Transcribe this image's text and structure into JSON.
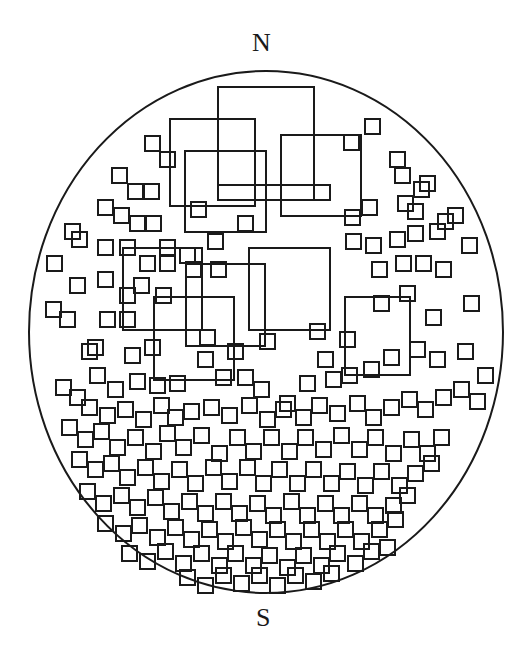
{
  "labels": {
    "north": "N",
    "south": "S"
  },
  "style": {
    "stroke": "#1a1a1a",
    "background": "#ffffff"
  },
  "boundary": {
    "cx": 266,
    "cy": 332,
    "rx": 237,
    "ry": 261
  },
  "large_squares": [
    [
      218,
      87,
      96,
      113
    ],
    [
      170,
      119,
      85,
      87
    ],
    [
      185,
      151,
      81,
      81
    ],
    [
      281,
      135,
      80,
      81
    ],
    [
      314,
      185,
      16,
      15
    ],
    [
      218,
      185,
      96,
      15
    ],
    [
      123,
      248,
      79,
      82
    ],
    [
      186,
      264,
      79,
      82
    ],
    [
      154,
      297,
      80,
      83
    ],
    [
      249,
      248,
      81,
      82
    ],
    [
      345,
      297,
      65,
      78
    ]
  ],
  "small_squares": [
    [
      365,
      119
    ],
    [
      344,
      135
    ],
    [
      145,
      136
    ],
    [
      160,
      152
    ],
    [
      112,
      168
    ],
    [
      128,
      184
    ],
    [
      144,
      184
    ],
    [
      395,
      168
    ],
    [
      390,
      152
    ],
    [
      98,
      200
    ],
    [
      114,
      208
    ],
    [
      130,
      216
    ],
    [
      146,
      216
    ],
    [
      191,
      202
    ],
    [
      208,
      234
    ],
    [
      238,
      216
    ],
    [
      345,
      210
    ],
    [
      362,
      200
    ],
    [
      414,
      182
    ],
    [
      420,
      176
    ],
    [
      398,
      196
    ],
    [
      408,
      204
    ],
    [
      65,
      224
    ],
    [
      72,
      232
    ],
    [
      98,
      240
    ],
    [
      120,
      240
    ],
    [
      140,
      256
    ],
    [
      160,
      256
    ],
    [
      180,
      248
    ],
    [
      186,
      262
    ],
    [
      211,
      262
    ],
    [
      346,
      234
    ],
    [
      366,
      238
    ],
    [
      390,
      232
    ],
    [
      408,
      226
    ],
    [
      430,
      224
    ],
    [
      438,
      214
    ],
    [
      448,
      208
    ],
    [
      462,
      238
    ],
    [
      47,
      256
    ],
    [
      70,
      278
    ],
    [
      98,
      272
    ],
    [
      120,
      288
    ],
    [
      134,
      278
    ],
    [
      156,
      288
    ],
    [
      160,
      240
    ],
    [
      372,
      262
    ],
    [
      396,
      256
    ],
    [
      416,
      256
    ],
    [
      436,
      262
    ],
    [
      46,
      302
    ],
    [
      60,
      312
    ],
    [
      82,
      344
    ],
    [
      100,
      312
    ],
    [
      120,
      312
    ],
    [
      125,
      348
    ],
    [
      145,
      340
    ],
    [
      200,
      330
    ],
    [
      228,
      344
    ],
    [
      260,
      334
    ],
    [
      310,
      324
    ],
    [
      318,
      352
    ],
    [
      340,
      332
    ],
    [
      374,
      296
    ],
    [
      400,
      286
    ],
    [
      426,
      310
    ],
    [
      464,
      296
    ],
    [
      88,
      340
    ],
    [
      90,
      368
    ],
    [
      108,
      382
    ],
    [
      130,
      374
    ],
    [
      150,
      378
    ],
    [
      170,
      376
    ],
    [
      198,
      352
    ],
    [
      216,
      370
    ],
    [
      238,
      370
    ],
    [
      254,
      382
    ],
    [
      280,
      396
    ],
    [
      300,
      376
    ],
    [
      326,
      372
    ],
    [
      342,
      368
    ],
    [
      364,
      362
    ],
    [
      384,
      350
    ],
    [
      410,
      342
    ],
    [
      430,
      352
    ],
    [
      458,
      344
    ],
    [
      478,
      368
    ],
    [
      56,
      380
    ],
    [
      70,
      390
    ],
    [
      82,
      400
    ],
    [
      100,
      408
    ],
    [
      118,
      402
    ],
    [
      136,
      412
    ],
    [
      154,
      398
    ],
    [
      168,
      410
    ],
    [
      184,
      404
    ],
    [
      204,
      400
    ],
    [
      222,
      408
    ],
    [
      242,
      398
    ],
    [
      260,
      412
    ],
    [
      276,
      402
    ],
    [
      296,
      410
    ],
    [
      312,
      398
    ],
    [
      330,
      406
    ],
    [
      350,
      396
    ],
    [
      366,
      410
    ],
    [
      384,
      400
    ],
    [
      402,
      392
    ],
    [
      418,
      402
    ],
    [
      436,
      390
    ],
    [
      454,
      382
    ],
    [
      470,
      394
    ],
    [
      62,
      420
    ],
    [
      78,
      432
    ],
    [
      94,
      424
    ],
    [
      110,
      440
    ],
    [
      128,
      430
    ],
    [
      146,
      444
    ],
    [
      160,
      426
    ],
    [
      176,
      440
    ],
    [
      194,
      428
    ],
    [
      212,
      446
    ],
    [
      230,
      430
    ],
    [
      246,
      444
    ],
    [
      264,
      430
    ],
    [
      282,
      444
    ],
    [
      298,
      430
    ],
    [
      316,
      442
    ],
    [
      334,
      428
    ],
    [
      352,
      442
    ],
    [
      368,
      430
    ],
    [
      386,
      446
    ],
    [
      404,
      432
    ],
    [
      420,
      446
    ],
    [
      434,
      430
    ],
    [
      72,
      452
    ],
    [
      88,
      462
    ],
    [
      104,
      456
    ],
    [
      120,
      470
    ],
    [
      138,
      460
    ],
    [
      154,
      474
    ],
    [
      172,
      462
    ],
    [
      188,
      476
    ],
    [
      206,
      460
    ],
    [
      222,
      474
    ],
    [
      240,
      460
    ],
    [
      256,
      476
    ],
    [
      272,
      462
    ],
    [
      290,
      476
    ],
    [
      306,
      462
    ],
    [
      324,
      476
    ],
    [
      340,
      464
    ],
    [
      358,
      478
    ],
    [
      374,
      464
    ],
    [
      392,
      478
    ],
    [
      408,
      466
    ],
    [
      424,
      456
    ],
    [
      80,
      484
    ],
    [
      96,
      496
    ],
    [
      114,
      488
    ],
    [
      130,
      500
    ],
    [
      148,
      490
    ],
    [
      164,
      504
    ],
    [
      182,
      494
    ],
    [
      198,
      506
    ],
    [
      216,
      494
    ],
    [
      232,
      506
    ],
    [
      250,
      496
    ],
    [
      266,
      508
    ],
    [
      284,
      494
    ],
    [
      300,
      508
    ],
    [
      318,
      496
    ],
    [
      334,
      508
    ],
    [
      352,
      496
    ],
    [
      368,
      508
    ],
    [
      386,
      498
    ],
    [
      400,
      488
    ],
    [
      98,
      516
    ],
    [
      116,
      526
    ],
    [
      132,
      518
    ],
    [
      150,
      530
    ],
    [
      168,
      520
    ],
    [
      184,
      532
    ],
    [
      202,
      522
    ],
    [
      218,
      534
    ],
    [
      236,
      520
    ],
    [
      252,
      532
    ],
    [
      270,
      522
    ],
    [
      286,
      534
    ],
    [
      304,
      522
    ],
    [
      320,
      534
    ],
    [
      338,
      522
    ],
    [
      354,
      534
    ],
    [
      372,
      522
    ],
    [
      388,
      512
    ],
    [
      122,
      546
    ],
    [
      140,
      554
    ],
    [
      158,
      544
    ],
    [
      176,
      556
    ],
    [
      194,
      546
    ],
    [
      212,
      558
    ],
    [
      228,
      546
    ],
    [
      246,
      558
    ],
    [
      262,
      548
    ],
    [
      280,
      560
    ],
    [
      296,
      548
    ],
    [
      314,
      558
    ],
    [
      330,
      546
    ],
    [
      348,
      556
    ],
    [
      364,
      544
    ],
    [
      380,
      540
    ],
    [
      180,
      570
    ],
    [
      198,
      578
    ],
    [
      216,
      568
    ],
    [
      234,
      576
    ],
    [
      252,
      568
    ],
    [
      270,
      578
    ],
    [
      288,
      568
    ],
    [
      306,
      574
    ],
    [
      324,
      566
    ]
  ],
  "small_size": 15
}
